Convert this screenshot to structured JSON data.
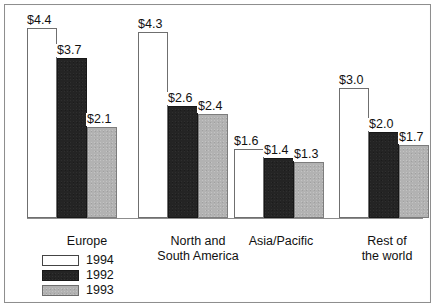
{
  "chart_data": {
    "type": "bar",
    "title": "",
    "subtitle": "",
    "xlabel": "",
    "ylabel": "",
    "grid": false,
    "legend_position": "bottom-left",
    "value_prefix": "$",
    "ylim": [
      0,
      4.7
    ],
    "categories": [
      "Europe",
      "North and\nSouth America",
      "Asia/Pacific",
      "Rest of\nthe world"
    ],
    "series": [
      {
        "name": "1994",
        "color": "#ffffff",
        "values": [
          4.4,
          4.3,
          1.6,
          3.0
        ],
        "labels": [
          "$4.4",
          "$4.3",
          "$1.6",
          "$3.0"
        ]
      },
      {
        "name": "1992",
        "color": "#242424",
        "values": [
          3.7,
          2.6,
          1.4,
          2.0
        ],
        "labels": [
          "$3.7",
          "$2.6",
          "$1.4",
          "$2.0"
        ]
      },
      {
        "name": "1993",
        "color": "#b2b2b2",
        "values": [
          2.1,
          2.4,
          1.3,
          1.7
        ],
        "labels": [
          "$2.1",
          "$2.4",
          "$1.3",
          "$1.7"
        ]
      }
    ],
    "legend_entries": [
      "1994",
      "1992",
      "1993"
    ]
  },
  "layout": {
    "group_left_px": [
      8,
      119,
      215,
      320
    ],
    "bar_width_px": 30,
    "px_per_unit": 43.2,
    "baseline_px": 203,
    "cat_label_left_px": [
      20,
      120,
      212,
      320
    ],
    "cat_label_width_px": [
      96,
      118,
      100,
      96
    ]
  }
}
